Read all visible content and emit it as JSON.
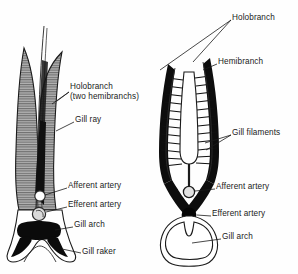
{
  "figure": {
    "background": "#fefefe",
    "ink": "#111111",
    "shade": "#9a9a9a"
  },
  "left_diagram": {
    "name": "longitudinal-gill-view",
    "labels": [
      {
        "id": "holobranch",
        "line1": "Holobranch",
        "line2": "(two hemibranchs)",
        "x": 70,
        "y": 86
      },
      {
        "id": "gill-ray",
        "text": "Gill ray",
        "x": 75,
        "y": 119
      },
      {
        "id": "afferent-artery",
        "text": "Afferent artery",
        "x": 68,
        "y": 185
      },
      {
        "id": "efferent-artery",
        "text": "Efferent artery",
        "x": 68,
        "y": 204
      },
      {
        "id": "gill-arch",
        "text": "Gill arch",
        "x": 74,
        "y": 224
      },
      {
        "id": "gill-raker",
        "text": "Gill raker",
        "x": 82,
        "y": 251
      }
    ]
  },
  "right_diagram": {
    "name": "cross-section-gill-view",
    "labels": [
      {
        "id": "holobranch",
        "text": "Holobranch",
        "x": 232,
        "y": 17
      },
      {
        "id": "hemibranch",
        "text": "Hemibranch",
        "x": 218,
        "y": 61
      },
      {
        "id": "gill-filaments",
        "text": "Gill filaments",
        "x": 232,
        "y": 132
      },
      {
        "id": "afferent-artery",
        "text": "Afferent artery",
        "x": 216,
        "y": 186
      },
      {
        "id": "efferent-artery",
        "text": "Efferent artery",
        "x": 212,
        "y": 213
      },
      {
        "id": "gill-arch",
        "text": "Gill arch",
        "x": 222,
        "y": 236
      }
    ]
  }
}
